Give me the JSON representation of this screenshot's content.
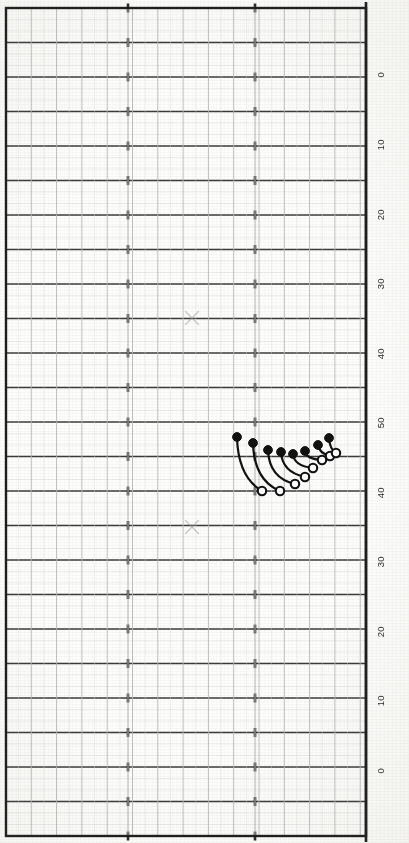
{
  "page": {
    "orientation": "rotated-90",
    "background_color": "#fdfdfb",
    "width": 409,
    "height": 843
  },
  "colors": {
    "major_grid": "#2b2b2b",
    "minor_grid": "#b9b9b9",
    "fine_grid": "#dcdcdc",
    "border": "#1d1d1d",
    "marker_filled": "#111111",
    "marker_open_stroke": "#111111",
    "marker_open_fill": "#ffffff",
    "curve": "#111111",
    "x_mark": "#9aa0a6",
    "label_text": "#2a2a2a"
  },
  "axis": {
    "name": "vertical-scale",
    "orientation": "right-edge-rotated",
    "tick_labels": [
      "0",
      "10",
      "20",
      "30",
      "40",
      "50",
      "40",
      "30",
      "20",
      "10",
      "0"
    ],
    "tick_y_positions": [
      75,
      145,
      215,
      284,
      354,
      423,
      493,
      562,
      632,
      701,
      771
    ],
    "major_line_spacing_px": 34.7,
    "label_x": 381
  },
  "grid": {
    "plot_left": 6,
    "plot_right": 366,
    "plot_top": 8,
    "plot_bottom": 836,
    "major_h_count": 24,
    "minor_h_per_major": 2,
    "vertical_major_spacing_px": 25.3,
    "vertical_minor_per_major": 2,
    "tick_columns_px": [
      128,
      255
    ],
    "show_grid": true
  },
  "chart_data": {
    "type": "scatter",
    "title": "",
    "subtitle": "",
    "xlabel": "",
    "ylabel": "",
    "xlim": [
      6,
      366
    ],
    "ylim": [
      8,
      836
    ],
    "grid": true,
    "legend": "none",
    "annotations": [
      {
        "name": "x-mark-upper",
        "symbol": "x",
        "x": 192,
        "y": 318,
        "color": "#9aa0a6",
        "size": 13
      },
      {
        "name": "x-mark-lower",
        "symbol": "x",
        "x": 192,
        "y": 527,
        "color": "#9aa0a6",
        "size": 13
      }
    ],
    "series": [
      {
        "name": "Filled markers (upper endpoints)",
        "marker": "filled-circle",
        "color": "#111111",
        "radius": 4.4,
        "points": [
          {
            "x": 237,
            "y": 437
          },
          {
            "x": 253,
            "y": 443
          },
          {
            "x": 268,
            "y": 450
          },
          {
            "x": 281,
            "y": 452
          },
          {
            "x": 293,
            "y": 454
          },
          {
            "x": 305,
            "y": 451
          },
          {
            "x": 318,
            "y": 445
          },
          {
            "x": 329,
            "y": 438
          }
        ]
      },
      {
        "name": "Open markers (lower endpoints)",
        "marker": "open-circle",
        "color": "#111111",
        "fill": "#ffffff",
        "radius": 4.2,
        "points": [
          {
            "x": 262,
            "y": 491
          },
          {
            "x": 280,
            "y": 491
          },
          {
            "x": 295,
            "y": 484
          },
          {
            "x": 305,
            "y": 477
          },
          {
            "x": 313,
            "y": 468
          },
          {
            "x": 322,
            "y": 460
          },
          {
            "x": 330,
            "y": 456
          },
          {
            "x": 336,
            "y": 453
          }
        ]
      }
    ],
    "connectors": [
      {
        "from": [
          237,
          437
        ],
        "to": [
          262,
          491
        ],
        "ctrl": [
          238,
          477
        ]
      },
      {
        "from": [
          253,
          443
        ],
        "to": [
          280,
          491
        ],
        "ctrl": [
          254,
          480
        ]
      },
      {
        "from": [
          268,
          450
        ],
        "to": [
          295,
          484
        ],
        "ctrl": [
          269,
          478
        ]
      },
      {
        "from": [
          281,
          452
        ],
        "to": [
          305,
          477
        ],
        "ctrl": [
          282,
          472
        ]
      },
      {
        "from": [
          293,
          454
        ],
        "to": [
          313,
          468
        ],
        "ctrl": [
          294,
          466
        ]
      },
      {
        "from": [
          305,
          451
        ],
        "to": [
          322,
          460
        ],
        "ctrl": [
          306,
          459
        ]
      },
      {
        "from": [
          318,
          445
        ],
        "to": [
          330,
          456
        ],
        "ctrl": [
          319,
          453
        ]
      },
      {
        "from": [
          329,
          438
        ],
        "to": [
          336,
          453
        ],
        "ctrl": [
          330,
          450
        ]
      }
    ]
  }
}
